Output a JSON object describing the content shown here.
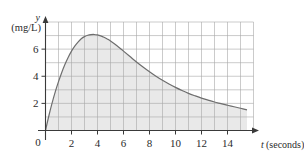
{
  "chart_data": {
    "type": "area",
    "title": "",
    "subtitle": "",
    "xlabel": "t (seconds)",
    "xlabel_symbol": "t",
    "xlabel_unit": "(seconds)",
    "ylabel": "(mg/L)",
    "ylabel_symbol": "y",
    "ylabel_unit": "(mg/L)",
    "xlim": [
      0,
      16
    ],
    "ylim": [
      0,
      8
    ],
    "grid": true,
    "grid_step_x": 1,
    "grid_step_y": 1,
    "legend": "none",
    "origin_label": "0",
    "xticks": [
      0,
      2,
      4,
      6,
      8,
      10,
      12,
      14
    ],
    "xtick_labels": [
      "0",
      "2",
      "4",
      "6",
      "8",
      "10",
      "12",
      "14"
    ],
    "yticks": [
      2,
      4,
      6
    ],
    "ytick_labels": [
      "2",
      "4",
      "6"
    ],
    "x": [
      0,
      0.25,
      0.5,
      0.75,
      1,
      1.25,
      1.5,
      1.75,
      2,
      2.25,
      2.5,
      2.75,
      3,
      3.25,
      3.5,
      3.75,
      4,
      4.25,
      4.5,
      4.75,
      5,
      5.5,
      6,
      6.5,
      7,
      7.5,
      8,
      8.5,
      9,
      9.5,
      10,
      10.5,
      11,
      11.5,
      12,
      12.5,
      13,
      13.5,
      14,
      14.5,
      15,
      15.5
    ],
    "values": [
      0,
      1.05,
      2.0,
      2.85,
      3.6,
      4.28,
      4.88,
      5.4,
      5.85,
      6.22,
      6.52,
      6.76,
      6.92,
      7.02,
      7.07,
      7.08,
      7.05,
      6.98,
      6.88,
      6.75,
      6.6,
      6.25,
      5.85,
      5.45,
      5.05,
      4.68,
      4.33,
      4.0,
      3.7,
      3.43,
      3.18,
      2.95,
      2.74,
      2.56,
      2.39,
      2.24,
      2.1,
      1.98,
      1.86,
      1.75,
      1.64,
      1.52
    ],
    "series": [
      {
        "name": "concentration",
        "values": [
          0,
          1.05,
          2.0,
          2.85,
          3.6,
          4.28,
          4.88,
          5.4,
          5.85,
          6.22,
          6.52,
          6.76,
          6.92,
          7.02,
          7.07,
          7.08,
          7.05,
          6.98,
          6.88,
          6.75,
          6.6,
          6.25,
          5.85,
          5.45,
          5.05,
          4.68,
          4.33,
          4.0,
          3.7,
          3.43,
          3.18,
          2.95,
          2.74,
          2.56,
          2.39,
          2.24,
          2.1,
          1.98,
          1.86,
          1.75,
          1.64,
          1.52
        ]
      }
    ],
    "peak": {
      "x": 3.8,
      "y": 7.08
    },
    "fill_color": "#e9e9e9",
    "curve_color": "#6e6e6e",
    "grid_color": "#a8a8a8",
    "axis_color": "#3a3a3a"
  }
}
